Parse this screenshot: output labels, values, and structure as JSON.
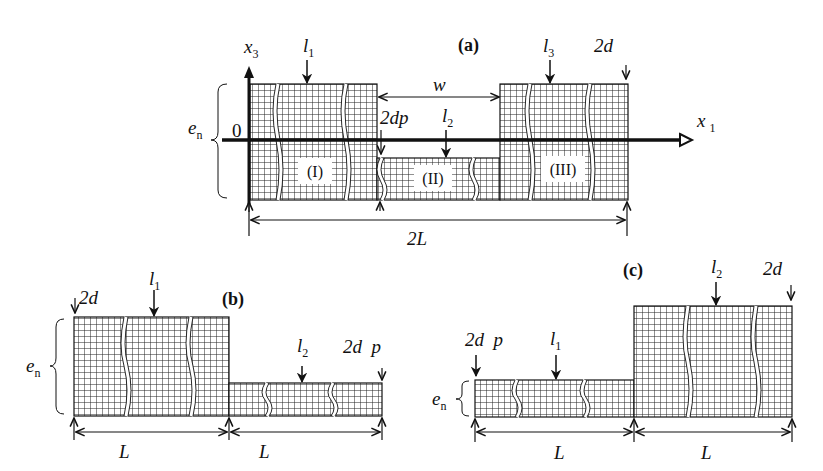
{
  "figure": {
    "panels": [
      {
        "id": "a",
        "label": "(a)",
        "axes": {
          "vertical": "x",
          "vertical_sub": "3",
          "horizontal": "x",
          "horizontal_sub": "1",
          "origin": "0"
        },
        "thickness_label": "e",
        "thickness_sub": "n",
        "regions": [
          "(I)",
          "(II)",
          "(III)"
        ],
        "loads": [
          {
            "name": "l",
            "sub": "1"
          },
          {
            "name": "l",
            "sub": "2"
          },
          {
            "name": "l",
            "sub": "3"
          }
        ],
        "gap_label": "w",
        "step_label": "2dp",
        "period_label": "2d",
        "length_label": "2L"
      },
      {
        "id": "b",
        "label": "(b)",
        "thickness_label": "e",
        "thickness_sub": "n",
        "loads": [
          {
            "name": "l",
            "sub": "1"
          },
          {
            "name": "l",
            "sub": "2"
          }
        ],
        "left_period_label": "2d",
        "right_period_label": "2d  p",
        "length_labels": [
          "L",
          "L"
        ]
      },
      {
        "id": "c",
        "label": "(c)",
        "thickness_label": "e",
        "thickness_sub": "n",
        "loads": [
          {
            "name": "l",
            "sub": "1"
          },
          {
            "name": "l",
            "sub": "2"
          }
        ],
        "left_period_label": "2d  p",
        "right_period_label": "2d",
        "length_labels": [
          "L",
          "L"
        ]
      }
    ]
  },
  "colors": {
    "ink": "#111111",
    "background": "#ffffff"
  }
}
